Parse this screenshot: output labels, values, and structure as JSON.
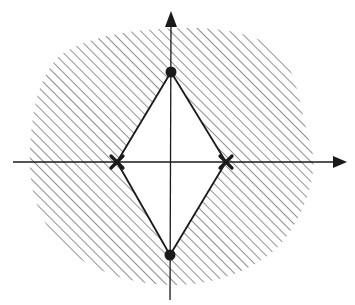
{
  "diagram": {
    "type": "pole-zero plot",
    "axes": {
      "horizontal": {
        "label": "",
        "arrow": true
      },
      "vertical": {
        "label": "",
        "arrow": true
      }
    },
    "markers": [
      {
        "kind": "dot",
        "position": "imaginary-axis-upper",
        "name": "zero-upper"
      },
      {
        "kind": "dot",
        "position": "imaginary-axis-lower",
        "name": "zero-lower"
      },
      {
        "kind": "cross",
        "position": "real-axis-left",
        "name": "pole-left"
      },
      {
        "kind": "cross",
        "position": "real-axis-right",
        "name": "pole-right"
      }
    ],
    "regions": [
      {
        "name": "hatched-region",
        "fill": "diagonal-hatch"
      },
      {
        "name": "diamond-region",
        "fill": "none"
      }
    ],
    "colors": {
      "ink": "#1a1a1a",
      "hatch": "#555555",
      "background": "#ffffff"
    }
  }
}
